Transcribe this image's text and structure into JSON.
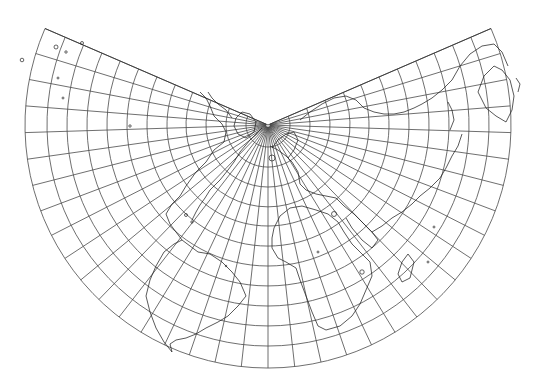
{
  "map": {
    "projection": "Lambert conformal conic (north polar)",
    "background": "#ffffff",
    "grid_color": "#4a4a4a",
    "coast_color": "#222222",
    "pole": {
      "x": 268,
      "y": 125
    },
    "cone_half_gap_deg": 23.4,
    "meridian_count": 36,
    "parallel_radii": [
      22,
      42,
      62,
      82,
      101,
      121,
      141,
      161,
      181,
      201,
      221,
      243
    ],
    "outer_radius": 243,
    "coastlines": [
      {
        "name": "north-america-east",
        "d": "M 262 128 L 250 140 L 240 152 L 234 162 L 228 170 L 220 180 L 210 190 L 205 198 L 200 205 L 196 212 L 192 220"
      },
      {
        "name": "north-america-west",
        "d": "M 200 92 L 206 98 L 210 106 L 214 116 L 222 124 L 226 132 L 224 142 L 214 150 L 206 162 L 196 172 L 186 186 L 180 196 L 172 204 L 166 214"
      },
      {
        "name": "central-america",
        "d": "M 166 214 L 170 224 L 176 232 L 182 240 L 190 246 L 198 252"
      },
      {
        "name": "south-america",
        "d": "M 198 252 L 210 254 L 222 262 L 232 272 L 240 282 L 246 296 L 238 306 L 228 316 L 218 322 L 206 328 L 196 334 L 186 338 L 176 340 L 170 344 L 172 352 L 164 342 L 156 328 L 150 312 L 146 296 L 150 280 L 156 266 L 164 252 L 174 244 L 182 240"
      },
      {
        "name": "greenland",
        "d": "M 236 118 L 242 112 L 250 114 L 256 122 L 254 132 L 246 138 L 238 134 L 234 126 Z"
      },
      {
        "name": "europe",
        "d": "M 270 146 L 278 150 L 286 156 L 292 162 L 298 172 L 300 184 L 306 190 L 316 194 L 326 196 L 336 198 L 344 206"
      },
      {
        "name": "scandinavia",
        "d": "M 272 148 L 278 140 L 286 134 L 294 132 L 298 140 L 294 150 L 288 158"
      },
      {
        "name": "africa",
        "d": "M 274 228 L 280 216 L 290 208 L 302 206 L 316 210 L 328 214 L 338 222 L 344 232 L 352 244 L 362 254 L 370 262 L 372 276 L 366 290 L 360 304 L 352 316 L 340 326 L 326 330 L 318 326 L 312 312 L 306 296 L 300 280 L 296 268 L 286 262 L 278 258 L 272 248 L 272 238 Z"
      },
      {
        "name": "madagascar",
        "d": "M 402 262 L 408 254 L 414 262 L 410 278 L 402 282 L 398 274 Z"
      },
      {
        "name": "arabia",
        "d": "M 344 206 L 354 214 L 364 224 L 372 232 L 378 240 L 372 248 L 362 240 L 352 228 L 346 218"
      },
      {
        "name": "asia-north",
        "d": "M 300 120 L 310 112 L 322 104 L 334 98 L 346 96 L 356 100 L 364 108 L 374 112 L 384 114 L 394 114 L 404 112 L 414 108 L 422 104"
      },
      {
        "name": "asia-south",
        "d": "M 372 232 L 382 226 L 392 218 L 402 212 L 412 204 L 420 196 L 430 188 L 440 178 L 446 168 L 452 156 L 458 146 L 462 134"
      },
      {
        "name": "asia-east",
        "d": "M 422 104 L 432 98 L 442 90 L 452 80 L 460 66 L 470 54 L 482 46 L 494 44 L 502 52 L 508 66"
      },
      {
        "name": "australia",
        "d": "M 484 76 L 478 92 L 486 108 L 496 116 L 506 122 L 512 110 L 514 96 L 510 80 L 502 70 L 494 66 Z"
      },
      {
        "name": "japan",
        "d": "M 448 102 L 452 110 L 454 120 L 450 130"
      },
      {
        "name": "new-zealand",
        "d": "M 516 78 L 520 84 L 518 92"
      },
      {
        "name": "baffin-canada",
        "d": "M 232 118 L 226 110 L 218 104 L 212 98 L 208 92"
      }
    ],
    "islands": [
      {
        "name": "hawaii-1",
        "x": 56,
        "y": 47,
        "r": 2
      },
      {
        "name": "hawaii-2",
        "x": 66,
        "y": 52,
        "r": 1.2
      },
      {
        "name": "pacific-isle-1",
        "x": 82,
        "y": 43,
        "r": 1.5
      },
      {
        "name": "pacific-isle-2",
        "x": 22,
        "y": 60,
        "r": 1.8
      },
      {
        "name": "pacific-isle-3",
        "x": 58,
        "y": 78,
        "r": 1
      },
      {
        "name": "pacific-isle-4",
        "x": 63,
        "y": 98,
        "r": 1
      },
      {
        "name": "pacific-isle-5",
        "x": 130,
        "y": 126,
        "r": 1.2
      },
      {
        "name": "caribbean-1",
        "x": 186,
        "y": 215,
        "r": 1.5
      },
      {
        "name": "caribbean-2",
        "x": 192,
        "y": 222,
        "r": 1.2
      },
      {
        "name": "iceland",
        "x": 272,
        "y": 158,
        "r": 3
      },
      {
        "name": "atlantic-isle",
        "x": 226,
        "y": 266,
        "r": 0.8
      },
      {
        "name": "st-helena",
        "x": 318,
        "y": 252,
        "r": 1
      },
      {
        "name": "mauritius",
        "x": 428,
        "y": 262,
        "r": 1
      },
      {
        "name": "indian-isle",
        "x": 434,
        "y": 227,
        "r": 1
      },
      {
        "name": "caspian",
        "x": 334,
        "y": 214,
        "r": 2.5
      },
      {
        "name": "lake-victoria",
        "x": 362,
        "y": 272,
        "r": 2.2
      }
    ]
  }
}
